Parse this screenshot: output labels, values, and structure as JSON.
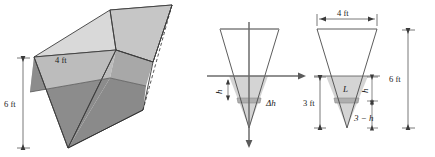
{
  "figure": {
    "stroke_color": "#3c3c3c",
    "dim_line_color": "#555555",
    "label_color": "#1a1a1a"
  },
  "panel_prism": {
    "name": "3D triangular prism trough",
    "labels": {
      "width_top": "4 ft",
      "height_side": "6 ft"
    },
    "colors": {
      "top_face_light": "#d5d5d5",
      "top_face_mid": "#c4c4c4",
      "front_upper": "#b8b8b8",
      "front_lower": "#8e8e8e",
      "side_face": "#a0a0a0",
      "water_face": "#9a9a9a",
      "edge": "#3c3c3c"
    }
  },
  "panel_axes": {
    "name": "Cross-section with coordinate axes",
    "labels": {
      "h": "h",
      "delta_h": "Δh"
    },
    "colors": {
      "axis": "#6b6b6b",
      "water_fill": "#d2d2d2",
      "slab_fill": "#b0b0b0",
      "outline": "#4a4a4a"
    }
  },
  "panel_dims": {
    "name": "Cross-section with dimensions",
    "labels": {
      "top_width": "4 ft",
      "total_height": "6 ft",
      "water_depth": "3 ft",
      "L": "L",
      "h": "h",
      "three_minus_h": "3 − h"
    },
    "colors": {
      "water_fill": "#d2d2d2",
      "slab_fill": "#b0b0b0",
      "outline": "#4a4a4a",
      "dim": "#555555"
    }
  }
}
